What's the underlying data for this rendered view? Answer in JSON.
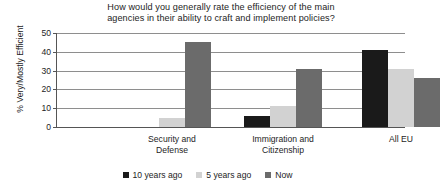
{
  "chart_data": {
    "type": "bar",
    "title": "How would you generally rate the efficiency of the main agencies in their ability to craft and implement policies?",
    "title_line1": "How would you generally rate the efficiency of the main",
    "title_line2": "agencies in their ability to craft and implement policies?",
    "xlabel": "",
    "ylabel": "% Very/Mostly Efficient",
    "ylim": [
      0,
      50
    ],
    "ytick_values": [
      0,
      10,
      20,
      30,
      40,
      50
    ],
    "ytick_labels": [
      "0",
      "10",
      "20",
      "30",
      "40",
      "50"
    ],
    "grid": true,
    "legend_position": "bottom",
    "categories": [
      "Security and Defense",
      "Immigration and Citizenship",
      "All EU"
    ],
    "category_lines": [
      [
        "Security and",
        "Defense"
      ],
      [
        "Immigration and",
        "Citizenship"
      ],
      [
        "All EU",
        ""
      ]
    ],
    "series": [
      {
        "name": "10 years ago",
        "color": "#1a1a1a",
        "values": [
          0,
          6,
          41
        ]
      },
      {
        "name": "5 years ago",
        "color": "#d2d2d2",
        "values": [
          5,
          11,
          31
        ]
      },
      {
        "name": "Now",
        "color": "#6b6b6b",
        "values": [
          45,
          31,
          26
        ]
      }
    ]
  }
}
